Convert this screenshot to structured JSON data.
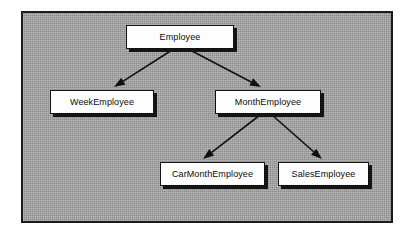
{
  "diagram": {
    "kind": "class-inheritance-hierarchy",
    "canvas": {
      "background_color": "#9b9b9b",
      "border_color": "#1b1b1b"
    },
    "node_style": {
      "fill_color": "#fdfdfd",
      "border_color": "#121212",
      "shadow_color": "#141414",
      "text_color": "#0c0c0c"
    },
    "connector_style": {
      "line_color": "#101010",
      "arrowhead": "solid-filled-triangle"
    },
    "nodes": [
      {
        "id": "employee",
        "label": "Employee",
        "x": 126,
        "y": 25,
        "w": 108,
        "h": 24
      },
      {
        "id": "week_employee",
        "label": "WeekEmployee",
        "x": 50,
        "y": 90,
        "w": 104,
        "h": 24
      },
      {
        "id": "month_employee",
        "label": "MonthEmployee",
        "x": 215,
        "y": 90,
        "w": 106,
        "h": 24
      },
      {
        "id": "car_month_employee",
        "label": "CarMonthEmployee",
        "x": 160,
        "y": 162,
        "w": 105,
        "h": 24
      },
      {
        "id": "sales_employee",
        "label": "SalesEmployee",
        "x": 278,
        "y": 162,
        "w": 91,
        "h": 24
      }
    ],
    "edges": [
      {
        "id": "employee-to-week-employee",
        "from": "employee",
        "to": "week_employee",
        "x1": 172,
        "y1": 50,
        "x2": 114,
        "y2": 87
      },
      {
        "id": "employee-to-month-employee",
        "from": "employee",
        "to": "month_employee",
        "x1": 190,
        "y1": 50,
        "x2": 261,
        "y2": 87
      },
      {
        "id": "month-employee-to-car-month-employee",
        "from": "month_employee",
        "to": "car_month_employee",
        "x1": 260,
        "y1": 115,
        "x2": 203,
        "y2": 159
      },
      {
        "id": "month-employee-to-sales-employee",
        "from": "month_employee",
        "to": "sales_employee",
        "x1": 272,
        "y1": 115,
        "x2": 322,
        "y2": 159
      }
    ]
  }
}
